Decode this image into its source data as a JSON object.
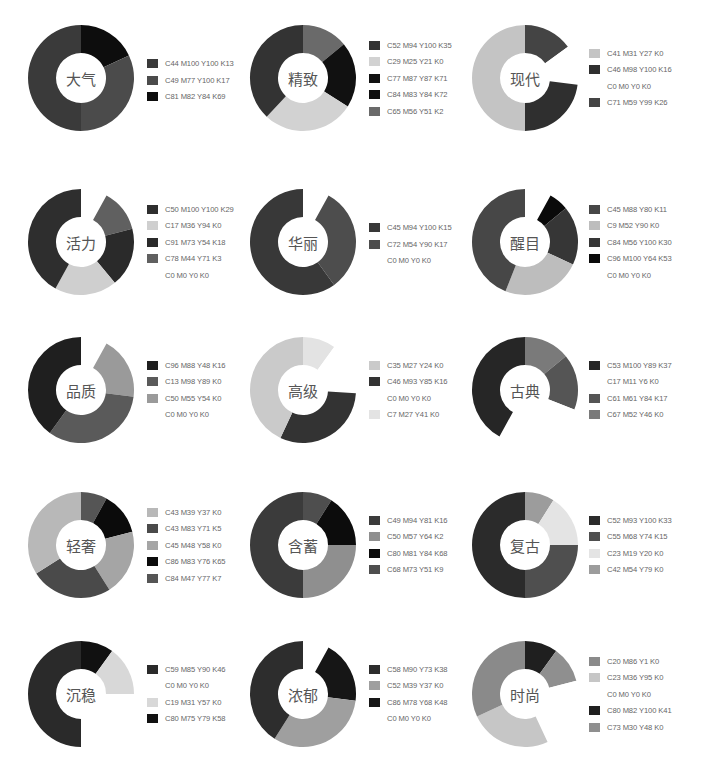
{
  "chart_data": [
    {
      "type": "pie",
      "title": "大气",
      "donut": true,
      "row": 0,
      "col": 0,
      "legend": [
        "C44 M100 Y100 K13",
        "C49 M77 Y100 K17",
        "C81 M82 Y84 K69"
      ],
      "colors": [
        "#3a3a3a",
        "#4b4b4b",
        "#0d0d0d"
      ],
      "slices": [
        {
          "color": "#0d0d0d",
          "value": 18
        },
        {
          "color": "#4b4b4b",
          "value": 32
        },
        {
          "color": "#3a3a3a",
          "value": 50
        }
      ]
    },
    {
      "type": "pie",
      "title": "精致",
      "donut": true,
      "row": 0,
      "col": 1,
      "legend": [
        "C52 M94 Y100 K35",
        "C29 M25 Y21 K0",
        "C77 M87 Y87 K71",
        "C84 M83 Y84 K72",
        "C65 M56 Y51 K2"
      ],
      "colors": [
        "#333333",
        "#d2d2d2",
        "#111111",
        "#0f0f0f",
        "#6a6a6a"
      ],
      "slices": [
        {
          "color": "#6a6a6a",
          "value": 14
        },
        {
          "color": "#111111",
          "value": 20
        },
        {
          "color": "#d2d2d2",
          "value": 28
        },
        {
          "color": "#333333",
          "value": 38
        }
      ]
    },
    {
      "type": "pie",
      "title": "现代",
      "donut": true,
      "row": 0,
      "col": 2,
      "legend": [
        "C41 M31 Y27 K0",
        "C46 M98 Y100 K16",
        "C0  M0  Y0  K0",
        "C71 M59 Y99 K26"
      ],
      "colors": [
        "#c4c4c4",
        "#2f2f2f",
        "#ffffff",
        "#444444"
      ],
      "slices": [
        {
          "color": "#444444",
          "value": 15
        },
        {
          "color": "#ffffff",
          "value": 12
        },
        {
          "color": "#2f2f2f",
          "value": 23
        },
        {
          "color": "#c4c4c4",
          "value": 50
        }
      ]
    },
    {
      "type": "pie",
      "title": "活力",
      "donut": true,
      "row": 1,
      "col": 0,
      "legend": [
        "C50 M100 Y100 K29",
        "C17 M36 Y94 K0",
        "C91 M73 Y54 K18",
        "C78 M44 Y71 K3",
        "C0  M0  Y0  K0"
      ],
      "colors": [
        "#2e2e2e",
        "#cfcfcf",
        "#2a2a2a",
        "#606060",
        "#ffffff"
      ],
      "slices": [
        {
          "color": "#ffffff",
          "value": 8
        },
        {
          "color": "#606060",
          "value": 13
        },
        {
          "color": "#2a2a2a",
          "value": 18
        },
        {
          "color": "#cfcfcf",
          "value": 19
        },
        {
          "color": "#2e2e2e",
          "value": 42
        }
      ]
    },
    {
      "type": "pie",
      "title": "华丽",
      "donut": true,
      "row": 1,
      "col": 1,
      "legend": [
        "C45 M94 Y100 K15",
        "C72 M54 Y90 K17",
        "C0  M0  Y0  K0"
      ],
      "colors": [
        "#383838",
        "#4d4d4d",
        "#ffffff"
      ],
      "slices": [
        {
          "color": "#ffffff",
          "value": 8
        },
        {
          "color": "#4d4d4d",
          "value": 32
        },
        {
          "color": "#383838",
          "value": 60
        }
      ]
    },
    {
      "type": "pie",
      "title": "醒目",
      "donut": true,
      "row": 1,
      "col": 2,
      "legend": [
        "C45 M88 Y80 K11",
        "C9 M52 Y90 K0",
        "C84 M56 Y100 K30",
        "C96 M100 Y64 K53",
        "C0  M0  Y0  K0"
      ],
      "colors": [
        "#474747",
        "#bdbdbd",
        "#363636",
        "#0a0a0a",
        "#ffffff"
      ],
      "slices": [
        {
          "color": "#ffffff",
          "value": 8
        },
        {
          "color": "#0a0a0a",
          "value": 6
        },
        {
          "color": "#363636",
          "value": 18
        },
        {
          "color": "#bdbdbd",
          "value": 24
        },
        {
          "color": "#474747",
          "value": 44
        }
      ]
    },
    {
      "type": "pie",
      "title": "品质",
      "donut": true,
      "row": 2,
      "col": 0,
      "legend": [
        "C96 M88 Y48 K16",
        "C13 M98 Y89 K0",
        "C50 M55 Y54 K0",
        "C0  M0  Y0  K0"
      ],
      "colors": [
        "#1f1f1f",
        "#5a5a5a",
        "#9a9a9a",
        "#ffffff"
      ],
      "slices": [
        {
          "color": "#ffffff",
          "value": 8
        },
        {
          "color": "#9a9a9a",
          "value": 19
        },
        {
          "color": "#5a5a5a",
          "value": 33
        },
        {
          "color": "#1f1f1f",
          "value": 40
        }
      ]
    },
    {
      "type": "pie",
      "title": "高级",
      "donut": true,
      "row": 2,
      "col": 1,
      "legend": [
        "C35 M27 Y24 K0",
        "C46 M93 Y85 K16",
        "C0  M0  Y0  K0",
        "C7 M27 Y41 K0"
      ],
      "colors": [
        "#cacaca",
        "#333333",
        "#ffffff",
        "#e3e3e3"
      ],
      "slices": [
        {
          "color": "#e3e3e3",
          "value": 10
        },
        {
          "color": "#ffffff",
          "value": 16
        },
        {
          "color": "#333333",
          "value": 31
        },
        {
          "color": "#cacaca",
          "value": 43
        }
      ]
    },
    {
      "type": "pie",
      "title": "古典",
      "donut": true,
      "row": 2,
      "col": 2,
      "legend": [
        "C53 M100 Y89 K37",
        "C17 M11 Y6 K0",
        "C61 M61 Y84 K17",
        "C67 M52 Y46 K0"
      ],
      "colors": [
        "#262626",
        "#ffffff",
        "#555555",
        "#7a7a7a"
      ],
      "slices": [
        {
          "color": "#7a7a7a",
          "value": 14
        },
        {
          "color": "#555555",
          "value": 17
        },
        {
          "color": "#ffffff",
          "value": 27
        },
        {
          "color": "#262626",
          "value": 42
        }
      ]
    },
    {
      "type": "pie",
      "title": "轻奢",
      "donut": true,
      "row": 3,
      "col": 0,
      "legend": [
        "C43 M39 Y37 K0",
        "C43 M83 Y71 K5",
        "C45 M48 Y58 K0",
        "C86 M83 Y76 K65",
        "C84 M47 Y77 K7"
      ],
      "colors": [
        "#b8b8b8",
        "#4a4a4a",
        "#a5a5a5",
        "#0b0b0b",
        "#555555"
      ],
      "slices": [
        {
          "color": "#555555",
          "value": 8
        },
        {
          "color": "#0b0b0b",
          "value": 13
        },
        {
          "color": "#a5a5a5",
          "value": 20
        },
        {
          "color": "#4a4a4a",
          "value": 25
        },
        {
          "color": "#b8b8b8",
          "value": 34
        }
      ]
    },
    {
      "type": "pie",
      "title": "含蓄",
      "donut": true,
      "row": 3,
      "col": 1,
      "legend": [
        "C49  M94  Y81  K16",
        "C50 M57 Y64 K2",
        "C80 M81 Y84 K68",
        "C68 M73 Y51 K9"
      ],
      "colors": [
        "#3b3b3b",
        "#8f8f8f",
        "#0c0c0c",
        "#4e4e4e"
      ],
      "slices": [
        {
          "color": "#4e4e4e",
          "value": 9
        },
        {
          "color": "#0c0c0c",
          "value": 16
        },
        {
          "color": "#8f8f8f",
          "value": 25
        },
        {
          "color": "#3b3b3b",
          "value": 50
        }
      ]
    },
    {
      "type": "pie",
      "title": "复古",
      "donut": true,
      "row": 3,
      "col": 2,
      "legend": [
        "C52  M93  Y100  K33",
        "C55 M68 Y74 K15",
        "C23 M19 Y20 K0",
        "C42 M54 Y79 K0"
      ],
      "colors": [
        "#2b2b2b",
        "#4f4f4f",
        "#e4e4e4",
        "#9c9c9c"
      ],
      "slices": [
        {
          "color": "#9c9c9c",
          "value": 9
        },
        {
          "color": "#e4e4e4",
          "value": 16
        },
        {
          "color": "#4f4f4f",
          "value": 25
        },
        {
          "color": "#2b2b2b",
          "value": 50
        }
      ]
    },
    {
      "type": "pie",
      "title": "沉稳",
      "donut": true,
      "row": 4,
      "col": 0,
      "legend": [
        "C59 M85 Y90 K46",
        "C0  M0  Y0  K0",
        "C19 M31 Y57 K0",
        "C80 M75 Y79 K58"
      ],
      "colors": [
        "#2a2a2a",
        "#ffffff",
        "#d8d8d8",
        "#111111"
      ],
      "slices": [
        {
          "color": "#111111",
          "value": 10
        },
        {
          "color": "#d8d8d8",
          "value": 15
        },
        {
          "color": "#ffffff",
          "value": 25
        },
        {
          "color": "#2a2a2a",
          "value": 50
        }
      ]
    },
    {
      "type": "pie",
      "title": "浓郁",
      "donut": true,
      "row": 4,
      "col": 1,
      "legend": [
        "C58 M90 Y73 K38",
        "C52 M39 Y37 K0",
        "C86 M78 Y68 K48",
        "C0  M0  Y0  K0"
      ],
      "colors": [
        "#2d2d2d",
        "#9f9f9f",
        "#161616",
        "#ffffff"
      ],
      "slices": [
        {
          "color": "#ffffff",
          "value": 8
        },
        {
          "color": "#161616",
          "value": 19
        },
        {
          "color": "#9f9f9f",
          "value": 32
        },
        {
          "color": "#2d2d2d",
          "value": 41
        }
      ]
    },
    {
      "type": "pie",
      "title": "时尚",
      "donut": true,
      "row": 4,
      "col": 2,
      "legend": [
        "C20 M86 Y1 K0",
        "C23 M36 Y95 K0",
        "C0  M0  Y0  K0",
        "C80 M82 Y100 K41",
        "C73 M30 Y48 K0"
      ],
      "colors": [
        "#8a8a8a",
        "#c6c6c6",
        "#ffffff",
        "#1f1f1f",
        "#8f8f8f"
      ],
      "slices": [
        {
          "color": "#1f1f1f",
          "value": 10
        },
        {
          "color": "#8f8f8f",
          "value": 11
        },
        {
          "color": "#ffffff",
          "value": 22
        },
        {
          "color": "#c6c6c6",
          "value": 25
        },
        {
          "color": "#8a8a8a",
          "value": 32
        }
      ]
    }
  ]
}
